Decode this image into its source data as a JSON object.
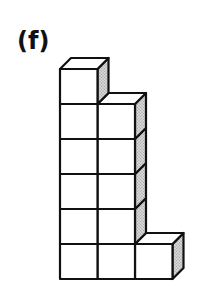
{
  "figure": {
    "label": "(f)",
    "columns": [
      {
        "index": 0,
        "height": 6
      },
      {
        "index": 1,
        "height": 5
      },
      {
        "index": 2,
        "height": 1
      }
    ],
    "total_cubes": 12,
    "colors": {
      "edge": "#111111",
      "front_face": "#ffffff",
      "side_face": "#c8c8c8"
    }
  }
}
